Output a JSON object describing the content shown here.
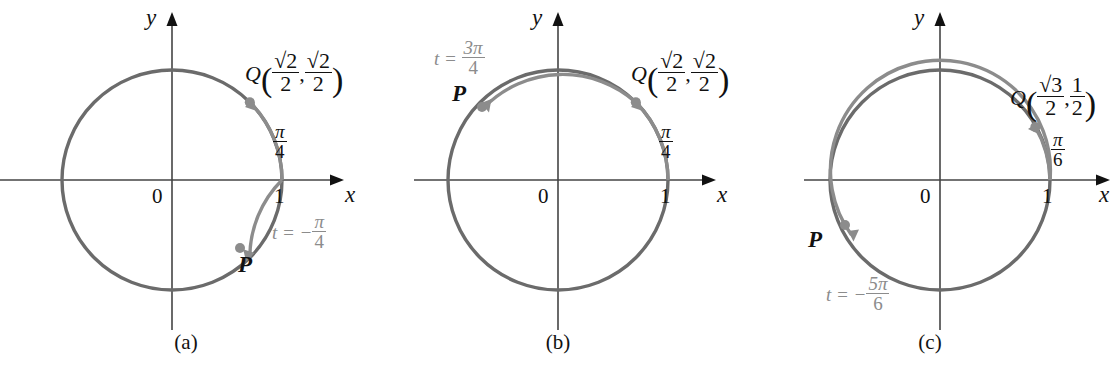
{
  "figure": {
    "type": "unit-circle-diagrams",
    "panel_count": 3,
    "stroke_color_circle": "#6b6b6b",
    "stroke_color_axis": "#444444",
    "accent_gray": "#8c8c8c",
    "text_color": "#111111"
  },
  "panels": [
    {
      "caption": "(a)",
      "axis": {
        "x_label": "x",
        "y_label": "y",
        "origin_label": "0",
        "tick_label": "1"
      },
      "q_point": {
        "name": "Q",
        "open_paren": "(",
        "close_paren": ")",
        "comma": ",",
        "coord_x": {
          "numerator": "√2",
          "denominator": "2"
        },
        "coord_y": {
          "numerator": "√2",
          "denominator": "2"
        },
        "angle_deg": 45
      },
      "p_point": {
        "name": "P",
        "angle_deg": -45
      },
      "arc_label": {
        "numerator": "π",
        "denominator": "4",
        "prefix": ""
      },
      "t_label": {
        "prefix": "t = −",
        "numerator": "π",
        "denominator": "4"
      },
      "arcs": [
        {
          "name": "arc-to-Q",
          "from_deg": 0,
          "to_deg": 45,
          "direction": "counterclockwise"
        },
        {
          "name": "arc-to-P",
          "from_deg": 0,
          "to_deg": -45,
          "direction": "clockwise"
        }
      ]
    },
    {
      "caption": "(b)",
      "axis": {
        "x_label": "x",
        "y_label": "y",
        "origin_label": "0",
        "tick_label": "1"
      },
      "q_point": {
        "name": "Q",
        "open_paren": "(",
        "close_paren": ")",
        "comma": ",",
        "coord_x": {
          "numerator": "√2",
          "denominator": "2"
        },
        "coord_y": {
          "numerator": "√2",
          "denominator": "2"
        },
        "angle_deg": 45
      },
      "p_point": {
        "name": "P",
        "angle_deg": 135
      },
      "arc_label": {
        "numerator": "π",
        "denominator": "4",
        "prefix": ""
      },
      "t_label": {
        "prefix": "t = ",
        "numerator": "3π",
        "denominator": "4"
      },
      "arcs": [
        {
          "name": "arc-to-Q",
          "from_deg": 0,
          "to_deg": 45,
          "direction": "counterclockwise"
        },
        {
          "name": "arc-to-P",
          "from_deg": 45,
          "to_deg": 135,
          "direction": "counterclockwise"
        }
      ]
    },
    {
      "caption": "(c)",
      "axis": {
        "x_label": "x",
        "y_label": "y",
        "origin_label": "0",
        "tick_label": "1"
      },
      "q_point": {
        "name": "Q",
        "open_paren": "(",
        "close_paren": ")",
        "comma": ",",
        "coord_x": {
          "numerator": "√3",
          "denominator": "2"
        },
        "coord_y": {
          "numerator": "1",
          "denominator": "2"
        },
        "angle_deg": 30
      },
      "p_point": {
        "name": "P",
        "angle_deg": 150
      },
      "arc_label": {
        "numerator": "π",
        "denominator": "6",
        "prefix": ""
      },
      "t_label": {
        "prefix": "t = −",
        "numerator": "5π",
        "denominator": "6"
      },
      "arcs": [
        {
          "name": "arc-to-Q",
          "from_deg": 0,
          "to_deg": 30,
          "direction": "counterclockwise"
        },
        {
          "name": "arc-to-P",
          "from_deg": 0,
          "to_deg": -210,
          "direction": "clockwise"
        }
      ]
    }
  ]
}
